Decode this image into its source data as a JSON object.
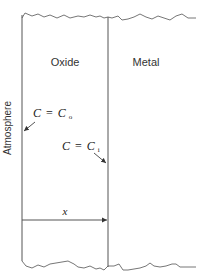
{
  "diagram": {
    "regions": {
      "atmosphere": "Atmosphere",
      "oxide": "Oxide",
      "metal": "Metal"
    },
    "annotations": {
      "outer_concentration": {
        "lhs": "C",
        "eq": "=",
        "rhs": "C",
        "sub": "o"
      },
      "inner_concentration": {
        "lhs": "C",
        "eq": "=",
        "rhs": "C",
        "sub": "i"
      },
      "thickness_label": "x"
    },
    "colors": {
      "line": "#555555",
      "text": "#333333",
      "background": "#ffffff"
    }
  }
}
